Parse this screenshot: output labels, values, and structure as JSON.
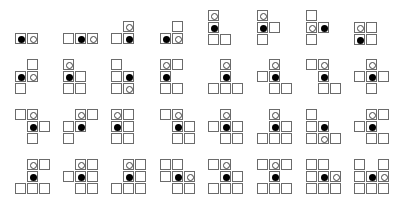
{
  "cell_size": 11,
  "colors": {
    "border": "#6b6b6b",
    "filled": "#000000",
    "empty_outline": "#444444"
  },
  "shapes": [
    {
      "x": 15,
      "y": 33,
      "cells": [
        [
          0,
          0,
          "filled"
        ],
        [
          0,
          1,
          "empty"
        ]
      ]
    },
    {
      "x": 63,
      "y": 33,
      "cells": [
        [
          0,
          0,
          ""
        ],
        [
          0,
          1,
          "filled"
        ],
        [
          0,
          2,
          "empty"
        ]
      ]
    },
    {
      "x": 111,
      "y": 21,
      "cells": [
        [
          0,
          1,
          "empty"
        ],
        [
          1,
          0,
          ""
        ],
        [
          1,
          1,
          "filled"
        ]
      ]
    },
    {
      "x": 160,
      "y": 21,
      "cells": [
        [
          0,
          1,
          ""
        ],
        [
          1,
          0,
          "filled"
        ],
        [
          1,
          1,
          "empty"
        ]
      ]
    },
    {
      "x": 208,
      "y": 10,
      "cells": [
        [
          0,
          0,
          "empty"
        ],
        [
          1,
          0,
          "filled"
        ],
        [
          2,
          0,
          ""
        ],
        [
          2,
          1,
          ""
        ]
      ]
    },
    {
      "x": 257,
      "y": 10,
      "cells": [
        [
          0,
          0,
          "empty"
        ],
        [
          1,
          0,
          "filled"
        ],
        [
          1,
          1,
          ""
        ],
        [
          2,
          0,
          ""
        ]
      ]
    },
    {
      "x": 306,
      "y": 10,
      "cells": [
        [
          0,
          0,
          ""
        ],
        [
          1,
          0,
          "empty"
        ],
        [
          1,
          1,
          "filled"
        ],
        [
          2,
          0,
          ""
        ]
      ]
    },
    {
      "x": 354,
      "y": 22,
      "cells": [
        [
          0,
          0,
          "empty"
        ],
        [
          0,
          1,
          ""
        ],
        [
          1,
          0,
          "filled"
        ],
        [
          1,
          1,
          ""
        ]
      ]
    },
    {
      "x": 15,
      "y": 59,
      "cells": [
        [
          0,
          1,
          ""
        ],
        [
          1,
          0,
          "filled"
        ],
        [
          1,
          1,
          "empty"
        ],
        [
          2,
          0,
          ""
        ]
      ]
    },
    {
      "x": 63,
      "y": 59,
      "cells": [
        [
          0,
          0,
          "empty"
        ],
        [
          1,
          0,
          "filled"
        ],
        [
          1,
          1,
          ""
        ],
        [
          2,
          0,
          ""
        ],
        [
          2,
          1,
          ""
        ]
      ]
    },
    {
      "x": 111,
      "y": 59,
      "cells": [
        [
          0,
          0,
          ""
        ],
        [
          1,
          0,
          ""
        ],
        [
          1,
          1,
          "filled"
        ],
        [
          2,
          0,
          ""
        ],
        [
          2,
          1,
          "empty"
        ]
      ]
    },
    {
      "x": 160,
      "y": 59,
      "cells": [
        [
          0,
          0,
          "empty"
        ],
        [
          0,
          1,
          ""
        ],
        [
          1,
          0,
          "filled"
        ],
        [
          2,
          0,
          ""
        ],
        [
          2,
          1,
          ""
        ]
      ]
    },
    {
      "x": 208,
      "y": 59,
      "cells": [
        [
          0,
          1,
          "empty"
        ],
        [
          1,
          1,
          "filled"
        ],
        [
          2,
          0,
          ""
        ],
        [
          2,
          1,
          ""
        ],
        [
          2,
          2,
          ""
        ]
      ]
    },
    {
      "x": 257,
      "y": 59,
      "cells": [
        [
          0,
          1,
          "empty"
        ],
        [
          1,
          0,
          ""
        ],
        [
          1,
          1,
          "filled"
        ],
        [
          2,
          1,
          ""
        ],
        [
          2,
          2,
          ""
        ]
      ]
    },
    {
      "x": 306,
      "y": 59,
      "cells": [
        [
          0,
          0,
          ""
        ],
        [
          0,
          1,
          "empty"
        ],
        [
          1,
          1,
          "filled"
        ],
        [
          2,
          1,
          ""
        ],
        [
          2,
          2,
          ""
        ]
      ]
    },
    {
      "x": 354,
      "y": 59,
      "cells": [
        [
          0,
          1,
          "empty"
        ],
        [
          1,
          0,
          ""
        ],
        [
          1,
          1,
          "filled"
        ],
        [
          1,
          2,
          ""
        ],
        [
          2,
          1,
          ""
        ]
      ]
    },
    {
      "x": 15,
      "y": 109,
      "cells": [
        [
          0,
          0,
          ""
        ],
        [
          0,
          1,
          "empty"
        ],
        [
          1,
          1,
          "filled"
        ],
        [
          1,
          2,
          ""
        ],
        [
          2,
          1,
          ""
        ]
      ]
    },
    {
      "x": 63,
      "y": 109,
      "cells": [
        [
          0,
          1,
          "empty"
        ],
        [
          0,
          2,
          ""
        ],
        [
          1,
          0,
          ""
        ],
        [
          1,
          1,
          "filled"
        ],
        [
          2,
          0,
          ""
        ]
      ]
    },
    {
      "x": 111,
      "y": 109,
      "cells": [
        [
          0,
          0,
          "empty"
        ],
        [
          0,
          1,
          ""
        ],
        [
          1,
          0,
          "filled"
        ],
        [
          1,
          1,
          ""
        ],
        [
          2,
          0,
          ""
        ],
        [
          2,
          1,
          ""
        ]
      ]
    },
    {
      "x": 160,
      "y": 109,
      "cells": [
        [
          0,
          0,
          ""
        ],
        [
          0,
          1,
          "empty"
        ],
        [
          1,
          1,
          "filled"
        ],
        [
          1,
          2,
          ""
        ],
        [
          2,
          1,
          ""
        ],
        [
          2,
          2,
          ""
        ]
      ]
    },
    {
      "x": 208,
      "y": 109,
      "cells": [
        [
          0,
          1,
          "empty"
        ],
        [
          1,
          0,
          ""
        ],
        [
          1,
          1,
          "filled"
        ],
        [
          1,
          2,
          ""
        ],
        [
          2,
          1,
          ""
        ],
        [
          2,
          2,
          ""
        ]
      ]
    },
    {
      "x": 257,
      "y": 109,
      "cells": [
        [
          0,
          1,
          "empty"
        ],
        [
          1,
          1,
          "filled"
        ],
        [
          1,
          2,
          ""
        ],
        [
          2,
          0,
          ""
        ],
        [
          2,
          1,
          ""
        ],
        [
          2,
          2,
          ""
        ]
      ]
    },
    {
      "x": 306,
      "y": 109,
      "cells": [
        [
          0,
          0,
          ""
        ],
        [
          1,
          0,
          ""
        ],
        [
          1,
          1,
          "filled"
        ],
        [
          2,
          0,
          ""
        ],
        [
          2,
          1,
          "empty"
        ],
        [
          2,
          2,
          ""
        ]
      ]
    },
    {
      "x": 354,
      "y": 109,
      "cells": [
        [
          0,
          1,
          "empty"
        ],
        [
          0,
          2,
          ""
        ],
        [
          1,
          0,
          ""
        ],
        [
          1,
          1,
          "filled"
        ],
        [
          2,
          1,
          ""
        ],
        [
          2,
          2,
          ""
        ]
      ]
    },
    {
      "x": 15,
      "y": 159,
      "cells": [
        [
          0,
          1,
          "empty"
        ],
        [
          0,
          2,
          ""
        ],
        [
          1,
          1,
          "filled"
        ],
        [
          2,
          0,
          ""
        ],
        [
          2,
          1,
          ""
        ],
        [
          2,
          2,
          ""
        ]
      ]
    },
    {
      "x": 63,
      "y": 159,
      "cells": [
        [
          0,
          1,
          "empty"
        ],
        [
          0,
          2,
          ""
        ],
        [
          1,
          0,
          ""
        ],
        [
          1,
          1,
          "filled"
        ],
        [
          1,
          2,
          ""
        ],
        [
          2,
          1,
          ""
        ],
        [
          2,
          2,
          ""
        ]
      ]
    },
    {
      "x": 111,
      "y": 159,
      "cells": [
        [
          0,
          1,
          "empty"
        ],
        [
          0,
          2,
          ""
        ],
        [
          1,
          1,
          "filled"
        ],
        [
          1,
          2,
          ""
        ],
        [
          2,
          0,
          ""
        ],
        [
          2,
          1,
          ""
        ],
        [
          2,
          2,
          ""
        ]
      ]
    },
    {
      "x": 160,
      "y": 159,
      "cells": [
        [
          0,
          0,
          ""
        ],
        [
          0,
          1,
          ""
        ],
        [
          1,
          0,
          ""
        ],
        [
          1,
          1,
          "filled"
        ],
        [
          1,
          2,
          "empty"
        ],
        [
          2,
          1,
          ""
        ],
        [
          2,
          2,
          ""
        ]
      ]
    },
    {
      "x": 208,
      "y": 159,
      "cells": [
        [
          0,
          0,
          ""
        ],
        [
          0,
          1,
          "empty"
        ],
        [
          1,
          1,
          "filled"
        ],
        [
          1,
          2,
          ""
        ],
        [
          2,
          0,
          ""
        ],
        [
          2,
          1,
          ""
        ],
        [
          2,
          2,
          ""
        ]
      ]
    },
    {
      "x": 257,
      "y": 159,
      "cells": [
        [
          0,
          0,
          ""
        ],
        [
          0,
          1,
          "empty"
        ],
        [
          0,
          2,
          ""
        ],
        [
          1,
          1,
          "filled"
        ],
        [
          2,
          0,
          ""
        ],
        [
          2,
          1,
          ""
        ],
        [
          2,
          2,
          ""
        ]
      ]
    },
    {
      "x": 306,
      "y": 159,
      "cells": [
        [
          0,
          0,
          ""
        ],
        [
          0,
          1,
          ""
        ],
        [
          1,
          0,
          ""
        ],
        [
          1,
          1,
          "filled"
        ],
        [
          1,
          2,
          "empty"
        ],
        [
          2,
          0,
          ""
        ],
        [
          2,
          1,
          ""
        ],
        [
          2,
          2,
          ""
        ]
      ]
    },
    {
      "x": 354,
      "y": 159,
      "cells": [
        [
          0,
          0,
          ""
        ],
        [
          0,
          2,
          ""
        ],
        [
          1,
          0,
          ""
        ],
        [
          1,
          1,
          "filled"
        ],
        [
          1,
          2,
          "empty"
        ],
        [
          2,
          0,
          ""
        ],
        [
          2,
          1,
          ""
        ],
        [
          2,
          2,
          ""
        ]
      ]
    }
  ]
}
